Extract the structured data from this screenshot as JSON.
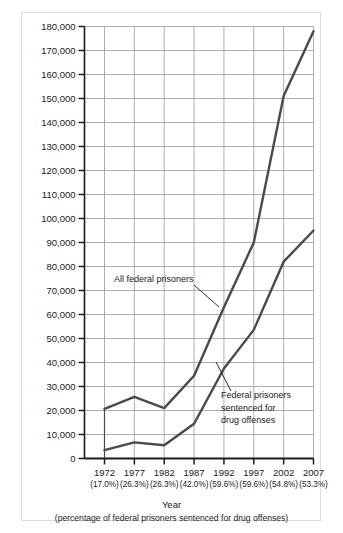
{
  "chart_data": {
    "type": "line",
    "title": "",
    "xlabel": "Year",
    "xlabel_sub": "(percentage of federal prisoners sentenced for drug offenses)",
    "ylabel": "",
    "ylim": [
      0,
      180000
    ],
    "ytick_step": 10000,
    "grid": true,
    "legend_position": "inline-annotations",
    "categories": [
      "1972",
      "1977",
      "1982",
      "1987",
      "1992",
      "1997",
      "2002",
      "2007"
    ],
    "x_sublabels": [
      "(17.0%)",
      "(26.3%)",
      "(26.3%)",
      "(42.0%)",
      "(59.6%)",
      "(59.6%)",
      "(54.8%)",
      "(53.3%)"
    ],
    "ytick_labels": [
      "180,000",
      "170,000",
      "160,000",
      "150,000",
      "140,000",
      "130,000",
      "120,000",
      "110,000",
      "100,000",
      "90,000",
      "80,000",
      "70,000",
      "60,000",
      "50,000",
      "40,000",
      "30,000",
      "20,000",
      "10,000",
      "0"
    ],
    "series": [
      {
        "name": "All federal prisoners",
        "color": "#4a4a4a",
        "values": [
          20700,
          25700,
          21000,
          34500,
          63000,
          90000,
          151000,
          178000
        ]
      },
      {
        "name": "Federal prisoners sentenced for drug offenses",
        "color": "#4a4a4a",
        "values": [
          3500,
          6700,
          5500,
          14500,
          37500,
          53600,
          82000,
          95000
        ]
      }
    ],
    "annotations": [
      {
        "id": "annotation-all-federal-prisoners",
        "lines": [
          "All federal prisoners"
        ],
        "text_x": 114,
        "text_y": 282,
        "leader": {
          "x1": 194,
          "y1": 285,
          "x2": 219,
          "y2": 307
        }
      },
      {
        "id": "annotation-drug-offenses",
        "lines": [
          "Federal prisoners",
          "sentenced for",
          "drug offenses"
        ],
        "text_x": 221,
        "text_y": 398,
        "leader": {
          "x1": 231,
          "y1": 391,
          "x2": 216,
          "y2": 362
        }
      }
    ]
  },
  "figure": {
    "background_color": "#ffffff",
    "frame_color": "#dcdcdc",
    "grid_color": "#9a9a9a",
    "axis_color": "#1a1a1a",
    "line_color": "#4a4a4a"
  }
}
